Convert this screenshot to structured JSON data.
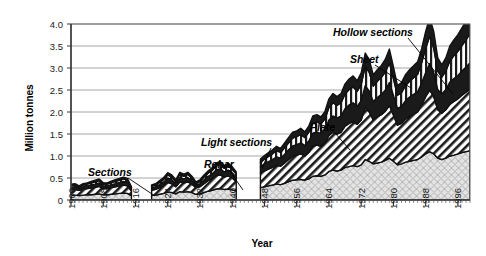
{
  "chart_data": {
    "type": "area",
    "title": "",
    "xlabel": "Year",
    "ylabel": "Million tonnes",
    "xlim": [
      1900,
      1999
    ],
    "ylim": [
      0,
      4.0
    ],
    "grid": true,
    "legend_position": "inline-annotations",
    "ytick_labels": [
      "0",
      "0.5",
      "1.0",
      "1.5",
      "2.0",
      "2.5",
      "3.0",
      "3.5",
      "4.0"
    ],
    "ytick_values": [
      0,
      0.5,
      1.0,
      1.5,
      2.0,
      2.5,
      3.0,
      3.5,
      4.0
    ],
    "xtick_labels": [
      "1900",
      "1908",
      "1916",
      "1924",
      "1932",
      "1940",
      "1948",
      "1956",
      "1964",
      "1972",
      "1980",
      "1988",
      "1996"
    ],
    "xtick_values": [
      1900,
      1908,
      1916,
      1924,
      1932,
      1940,
      1948,
      1956,
      1964,
      1972,
      1980,
      1988,
      1996
    ],
    "minor_ticks": true,
    "annotations": [
      {
        "label": "Sections",
        "x": 88,
        "y": 176,
        "leader_to_x": 155,
        "leader_to_y": 196
      },
      {
        "label": "Rebar",
        "x": 204,
        "y": 168,
        "leader_to_x": 243,
        "leader_to_y": 190
      },
      {
        "label": "Light sections",
        "x": 201,
        "y": 146,
        "leader_to_x": 262,
        "leader_to_y": 168
      },
      {
        "label": "Plate",
        "x": 310,
        "y": 131,
        "leader_to_x": 350,
        "leader_to_y": 150
      },
      {
        "label": "Sheet",
        "x": 350,
        "y": 63,
        "leader_to_x": 411,
        "leader_to_y": 88
      },
      {
        "label": "Hollow sections",
        "x": 333,
        "y": 36,
        "leader_to_x": 453,
        "leader_to_y": 94
      }
    ],
    "gaps": [
      [
        1915,
        1920
      ],
      [
        1941,
        1947
      ],
      [
        1915,
        1920
      ]
    ],
    "x": [
      1900,
      1901,
      1902,
      1903,
      1904,
      1905,
      1906,
      1907,
      1908,
      1909,
      1910,
      1911,
      1912,
      1913,
      1914,
      1915,
      1920,
      1921,
      1922,
      1923,
      1924,
      1925,
      1926,
      1927,
      1928,
      1929,
      1930,
      1931,
      1932,
      1933,
      1934,
      1935,
      1936,
      1937,
      1938,
      1939,
      1940,
      1941,
      1947,
      1948,
      1949,
      1950,
      1951,
      1952,
      1953,
      1954,
      1955,
      1956,
      1957,
      1958,
      1959,
      1960,
      1961,
      1962,
      1963,
      1964,
      1965,
      1966,
      1967,
      1968,
      1969,
      1970,
      1971,
      1972,
      1973,
      1974,
      1975,
      1976,
      1977,
      1978,
      1979,
      1980,
      1981,
      1982,
      1983,
      1984,
      1985,
      1986,
      1987,
      1988,
      1989,
      1990,
      1991,
      1992,
      1993,
      1994,
      1995,
      1996,
      1997,
      1998,
      1999
    ],
    "series": [
      {
        "name": "Rebar",
        "pattern": "dotted-crosshatch-gray",
        "color": "#d9d9d9",
        "values": [
          0.1,
          0.11,
          0.1,
          0.11,
          0.12,
          0.12,
          0.13,
          0.14,
          0.12,
          0.12,
          0.13,
          0.14,
          0.15,
          0.16,
          0.15,
          0.1,
          0.1,
          0.11,
          0.13,
          0.15,
          0.18,
          0.17,
          0.14,
          0.19,
          0.18,
          0.19,
          0.17,
          0.13,
          0.14,
          0.17,
          0.2,
          0.22,
          0.25,
          0.26,
          0.24,
          0.25,
          0.23,
          0.2,
          0.28,
          0.3,
          0.32,
          0.34,
          0.36,
          0.35,
          0.38,
          0.42,
          0.45,
          0.46,
          0.47,
          0.45,
          0.48,
          0.54,
          0.55,
          0.54,
          0.57,
          0.65,
          0.68,
          0.66,
          0.68,
          0.74,
          0.76,
          0.78,
          0.76,
          0.8,
          0.92,
          0.88,
          0.82,
          0.84,
          0.86,
          0.9,
          0.95,
          0.88,
          0.8,
          0.82,
          0.86,
          0.88,
          0.9,
          0.92,
          0.98,
          1.05,
          1.1,
          1.05,
          0.95,
          0.92,
          0.95,
          1.0,
          1.02,
          1.05,
          1.08,
          1.1,
          1.12
        ]
      },
      {
        "name": "Light sections",
        "pattern": "diagonal-hatch",
        "color": "#ffffff",
        "values": [
          0.13,
          0.13,
          0.12,
          0.13,
          0.14,
          0.15,
          0.16,
          0.17,
          0.14,
          0.14,
          0.15,
          0.16,
          0.17,
          0.18,
          0.17,
          0.1,
          0.12,
          0.13,
          0.15,
          0.18,
          0.22,
          0.2,
          0.16,
          0.22,
          0.21,
          0.22,
          0.19,
          0.15,
          0.16,
          0.2,
          0.24,
          0.26,
          0.3,
          0.31,
          0.28,
          0.3,
          0.27,
          0.22,
          0.33,
          0.36,
          0.38,
          0.4,
          0.43,
          0.42,
          0.46,
          0.5,
          0.54,
          0.56,
          0.58,
          0.55,
          0.6,
          0.68,
          0.7,
          0.68,
          0.72,
          0.82,
          0.86,
          0.84,
          0.86,
          0.94,
          0.98,
          1.0,
          0.96,
          1.02,
          1.18,
          1.12,
          1.0,
          1.05,
          1.08,
          1.12,
          1.2,
          1.05,
          0.9,
          0.92,
          0.98,
          1.02,
          1.05,
          1.08,
          1.18,
          1.3,
          1.4,
          1.3,
          1.1,
          1.05,
          1.1,
          1.18,
          1.22,
          1.25,
          1.3,
          1.35,
          1.4
        ]
      },
      {
        "name": "Plate",
        "pattern": "solid-black",
        "color": "#1a1a1a",
        "values": [
          0.06,
          0.06,
          0.05,
          0.06,
          0.06,
          0.07,
          0.07,
          0.08,
          0.06,
          0.06,
          0.07,
          0.07,
          0.08,
          0.08,
          0.08,
          0.05,
          0.05,
          0.06,
          0.07,
          0.08,
          0.1,
          0.09,
          0.07,
          0.1,
          0.09,
          0.1,
          0.08,
          0.06,
          0.07,
          0.09,
          0.1,
          0.11,
          0.13,
          0.14,
          0.12,
          0.13,
          0.12,
          0.1,
          0.14,
          0.16,
          0.17,
          0.18,
          0.19,
          0.18,
          0.2,
          0.22,
          0.24,
          0.24,
          0.25,
          0.24,
          0.26,
          0.3,
          0.3,
          0.29,
          0.31,
          0.35,
          0.37,
          0.36,
          0.37,
          0.4,
          0.42,
          0.43,
          0.41,
          0.44,
          0.5,
          0.48,
          0.42,
          0.44,
          0.46,
          0.48,
          0.52,
          0.45,
          0.38,
          0.39,
          0.42,
          0.44,
          0.45,
          0.46,
          0.5,
          0.55,
          0.6,
          0.55,
          0.46,
          0.44,
          0.46,
          0.5,
          0.52,
          0.53,
          0.55,
          0.57,
          0.6
        ]
      },
      {
        "name": "Sheet",
        "pattern": "vertical-stripes",
        "color": "#ffffff",
        "values": [
          0.04,
          0.04,
          0.03,
          0.04,
          0.04,
          0.05,
          0.05,
          0.05,
          0.04,
          0.04,
          0.05,
          0.05,
          0.05,
          0.06,
          0.05,
          0.03,
          0.04,
          0.04,
          0.05,
          0.06,
          0.07,
          0.06,
          0.05,
          0.07,
          0.06,
          0.07,
          0.06,
          0.04,
          0.05,
          0.06,
          0.07,
          0.08,
          0.09,
          0.1,
          0.08,
          0.09,
          0.08,
          0.07,
          0.1,
          0.11,
          0.12,
          0.13,
          0.14,
          0.13,
          0.15,
          0.16,
          0.18,
          0.18,
          0.19,
          0.18,
          0.2,
          0.23,
          0.23,
          0.22,
          0.24,
          0.28,
          0.3,
          0.29,
          0.3,
          0.33,
          0.35,
          0.36,
          0.34,
          0.37,
          0.44,
          0.42,
          0.35,
          0.37,
          0.39,
          0.41,
          0.45,
          0.38,
          0.3,
          0.31,
          0.34,
          0.36,
          0.38,
          0.4,
          0.46,
          0.55,
          0.62,
          0.55,
          0.42,
          0.38,
          0.42,
          0.48,
          0.52,
          0.55,
          0.58,
          0.62,
          0.66
        ]
      },
      {
        "name": "Hollow sections",
        "pattern": "solid-black",
        "color": "#1a1a1a",
        "values": [
          0.03,
          0.03,
          0.02,
          0.03,
          0.03,
          0.03,
          0.04,
          0.04,
          0.03,
          0.03,
          0.03,
          0.04,
          0.04,
          0.04,
          0.04,
          0.02,
          0.03,
          0.03,
          0.04,
          0.04,
          0.05,
          0.05,
          0.04,
          0.05,
          0.05,
          0.05,
          0.04,
          0.03,
          0.04,
          0.05,
          0.05,
          0.06,
          0.07,
          0.07,
          0.06,
          0.07,
          0.06,
          0.05,
          0.08,
          0.08,
          0.09,
          0.09,
          0.1,
          0.09,
          0.11,
          0.12,
          0.13,
          0.13,
          0.14,
          0.13,
          0.14,
          0.16,
          0.16,
          0.16,
          0.17,
          0.2,
          0.21,
          0.2,
          0.21,
          0.23,
          0.24,
          0.25,
          0.24,
          0.26,
          0.3,
          0.29,
          0.25,
          0.26,
          0.27,
          0.29,
          0.31,
          0.27,
          0.22,
          0.23,
          0.25,
          0.26,
          0.27,
          0.28,
          0.32,
          0.38,
          0.42,
          0.38,
          0.3,
          0.28,
          0.3,
          0.34,
          0.36,
          0.38,
          0.4,
          0.42,
          0.45
        ]
      }
    ]
  }
}
